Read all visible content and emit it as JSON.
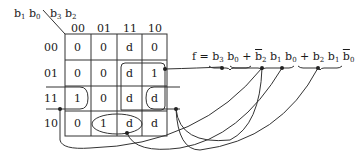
{
  "kmap": {
    "row_var": {
      "a": "b",
      "a_sub": "1",
      "b": "b",
      "b_sub": "0"
    },
    "col_var": {
      "a": "b",
      "a_sub": "3",
      "b": "b",
      "b_sub": "2"
    },
    "col_headers": [
      "00",
      "01",
      "11",
      "10"
    ],
    "row_headers": [
      "00",
      "01",
      "11",
      "10"
    ],
    "cells": [
      [
        "0",
        "0",
        "d",
        "0"
      ],
      [
        "0",
        "0",
        "d",
        "1"
      ],
      [
        "1",
        "0",
        "d",
        "d"
      ],
      [
        "0",
        "1",
        "d",
        "d"
      ]
    ]
  },
  "equation": {
    "lhs": "f",
    "eq": "=",
    "plus": "+",
    "terms": [
      {
        "text": "b3 b0"
      },
      {
        "text": "b2' b1 b0"
      },
      {
        "text": "b2 b1 b0'"
      }
    ],
    "b": "b",
    "s3": "3",
    "s2": "2",
    "s1": "1",
    "s0": "0"
  }
}
